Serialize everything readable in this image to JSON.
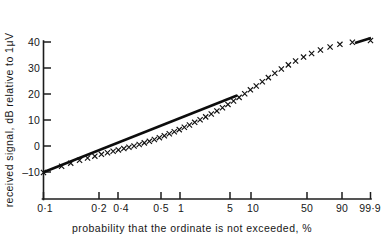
{
  "chart_data": {
    "type": "scatter",
    "title": "",
    "xlabel": "probability that the ordinate is not exceeded, %",
    "ylabel": "received signal, dB relative to 1μV",
    "x_scale": "normal-probability",
    "xlim": [
      0.1,
      99.9
    ],
    "ylim": [
      -14,
      42
    ],
    "grid": false,
    "legend": "none",
    "x_tick_labels": [
      "0·1",
      "0·2",
      "0·4",
      "0·5",
      "1",
      "5",
      "10",
      "50",
      "90",
      "99·9"
    ],
    "x_tick_values": [
      0.1,
      0.2,
      0.4,
      0.5,
      1,
      5,
      10,
      50,
      90,
      99.9
    ],
    "y_tick_labels": [
      "40",
      "30",
      "20",
      "10",
      "0",
      "–10"
    ],
    "y_tick_values": [
      40,
      30,
      20,
      10,
      0,
      -10
    ],
    "series": [
      {
        "name": "measured distribution",
        "marker": "x",
        "x": [
          0.1,
          0.3,
          0.5,
          0.8,
          1.2,
          1.7,
          2.3,
          3.0,
          3.8,
          4.7,
          5.8,
          7.0,
          8.4,
          10.0,
          11.8,
          13.8,
          16.0,
          18.4,
          21.0,
          23.8,
          26.8,
          30.0,
          33.4,
          37.0,
          40.8,
          44.8,
          49.0,
          53.2,
          57.4,
          61.5,
          65.4,
          69.2,
          72.8,
          76.2,
          79.4,
          82.4,
          85.2,
          87.7,
          90.0,
          92.0,
          93.8,
          95.3,
          96.6,
          97.6,
          98.4,
          99.0,
          99.4,
          99.7,
          99.9
        ],
        "y": [
          -10.2,
          -7.8,
          -6.6,
          -5.5,
          -4.6,
          -3.9,
          -3.2,
          -2.6,
          -2.0,
          -1.5,
          -1.0,
          -0.5,
          0.0,
          0.6,
          1.2,
          1.8,
          2.5,
          3.2,
          3.9,
          4.7,
          5.5,
          6.3,
          7.2,
          8.1,
          9.1,
          10.1,
          11.2,
          12.3,
          13.5,
          14.7,
          16.0,
          17.3,
          18.7,
          20.1,
          21.6,
          23.1,
          24.7,
          26.3,
          28.0,
          29.6,
          31.2,
          32.7,
          34.2,
          35.6,
          36.9,
          38.1,
          39.1,
          39.9,
          40.6
        ]
      },
      {
        "name": "log-normal reference line",
        "marker": "line",
        "x": [
          0.1,
          6.0
        ],
        "y": [
          -10.0,
          20.2
        ]
      }
    ],
    "annotations": [
      {
        "text": "thickened tail segment near upper end",
        "x": 99.0,
        "y": 39.0
      }
    ]
  },
  "axis": {
    "y_title": "received signal, dB relative to 1μV",
    "x_title": "probability that the ordinate is not exceeded, %"
  }
}
